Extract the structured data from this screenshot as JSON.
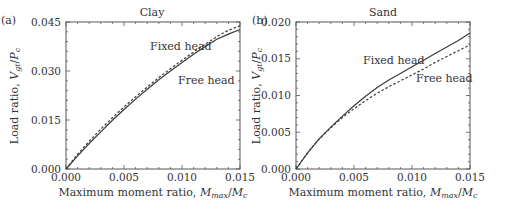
{
  "chart_data": [
    {
      "panel": "(a)",
      "type": "line",
      "title": "Clay",
      "xlabel": "Maximum moment ratio, M_max/M_c",
      "ylabel": "Load ratio, V_gt/P_c",
      "xlim": [
        0.0,
        0.015
      ],
      "ylim": [
        0.0,
        0.045
      ],
      "xticks": [
        "0.000",
        "0.005",
        "0.010",
        "0.015"
      ],
      "yticks": [
        "0.000",
        "0.015",
        "0.030",
        "0.045"
      ],
      "grid": false,
      "series": [
        {
          "name": "Fixed head",
          "style": "dashed",
          "x": [
            0.0,
            0.001,
            0.002,
            0.003,
            0.004,
            0.005,
            0.006,
            0.007,
            0.008,
            0.009,
            0.01,
            0.011,
            0.012,
            0.013,
            0.014,
            0.015
          ],
          "y": [
            0.0,
            0.0045,
            0.0085,
            0.0122,
            0.0157,
            0.019,
            0.0221,
            0.0251,
            0.028,
            0.0307,
            0.0333,
            0.0358,
            0.0382,
            0.0405,
            0.0425,
            0.0438
          ]
        },
        {
          "name": "Free head",
          "style": "solid",
          "x": [
            0.0,
            0.001,
            0.002,
            0.003,
            0.004,
            0.005,
            0.006,
            0.007,
            0.008,
            0.009,
            0.01,
            0.011,
            0.012,
            0.013,
            0.014,
            0.015
          ],
          "y": [
            0.0,
            0.004,
            0.0078,
            0.0114,
            0.0149,
            0.0182,
            0.0214,
            0.0244,
            0.0273,
            0.03,
            0.0326,
            0.0351,
            0.0375,
            0.0397,
            0.0413,
            0.0427
          ]
        }
      ],
      "annotations": [
        {
          "text": "Fixed head",
          "x": 0.0099,
          "y": 0.0355
        },
        {
          "text": "Free head",
          "x": 0.0115,
          "y": 0.0283
        }
      ]
    },
    {
      "panel": "(b)",
      "type": "line",
      "title": "Sand",
      "xlabel": "Maximum moment ratio, M_max/M_c",
      "ylabel": "Load ratio, V_gt/P_c",
      "xlim": [
        0.0,
        0.015
      ],
      "ylim": [
        0.0,
        0.02
      ],
      "xticks": [
        "0.000",
        "0.005",
        "0.010",
        "0.015"
      ],
      "yticks": [
        "0.000",
        "0.005",
        "0.010",
        "0.015",
        "0.020"
      ],
      "grid": false,
      "series": [
        {
          "name": "Fixed head",
          "style": "solid",
          "x": [
            0.0,
            0.001,
            0.002,
            0.003,
            0.004,
            0.005,
            0.006,
            0.007,
            0.008,
            0.009,
            0.01,
            0.011,
            0.012,
            0.013,
            0.014,
            0.015
          ],
          "y": [
            0.0,
            0.0022,
            0.0041,
            0.0057,
            0.0072,
            0.0086,
            0.0099,
            0.0111,
            0.0121,
            0.013,
            0.0139,
            0.0148,
            0.0157,
            0.0166,
            0.0175,
            0.0185
          ]
        },
        {
          "name": "Free head",
          "style": "dashed",
          "x": [
            0.0,
            0.001,
            0.002,
            0.003,
            0.004,
            0.005,
            0.006,
            0.007,
            0.008,
            0.009,
            0.01,
            0.011,
            0.012,
            0.013,
            0.014,
            0.015
          ],
          "y": [
            0.0,
            0.0022,
            0.0041,
            0.0056,
            0.007,
            0.0082,
            0.0093,
            0.0103,
            0.0112,
            0.012,
            0.0128,
            0.0136,
            0.0145,
            0.0153,
            0.0161,
            0.0169
          ]
        }
      ],
      "annotations": [
        {
          "text": "Fixed head",
          "x": 0.0072,
          "y": 0.0145
        },
        {
          "text": "Free head",
          "x": 0.0104,
          "y": 0.0121
        }
      ]
    }
  ],
  "panels": [
    {
      "tag": "(a)",
      "title": "Clay",
      "ylabel_prefix": "Load ratio, ",
      "ylabel_var": "V",
      "ylabel_sub": "gt",
      "ylabel_mid": "/",
      "ylabel_var2": "P",
      "ylabel_sub2": "c",
      "xlabel_prefix": "Maximum moment ratio, ",
      "xlabel_var": "M",
      "xlabel_sub": "max",
      "xlabel_mid": "/",
      "xlabel_var2": "M",
      "xlabel_sub2": "c",
      "label_fixed": "Fixed head",
      "label_free": "Free head"
    },
    {
      "tag": "(b)",
      "title": "Sand",
      "ylabel_prefix": "Load ratio, ",
      "ylabel_var": "V",
      "ylabel_sub": "gt",
      "ylabel_mid": "/",
      "ylabel_var2": "P",
      "ylabel_sub2": "c",
      "xlabel_prefix": "Maximum moment ratio, ",
      "xlabel_var": "M",
      "xlabel_sub": "max",
      "xlabel_mid": "/",
      "xlabel_var2": "M",
      "xlabel_sub2": "c",
      "label_fixed": "Fixed head",
      "label_free": "Free head"
    }
  ],
  "colors": {
    "line": "#3a3a3a",
    "axis": "#555555",
    "text": "#333333"
  }
}
